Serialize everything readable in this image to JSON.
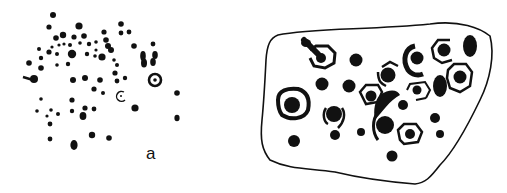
{
  "figure": {
    "panels": [
      {
        "id": "a",
        "label": "a",
        "description": "Scattered cup-marks (dots) with one concentric ring and one small open ring"
      },
      {
        "id": "b",
        "label": "b",
        "description": "Rock surface outline with cup-marks surrounded by rings and arcs"
      }
    ],
    "colors": {
      "ink": "#111111",
      "background": "#ffffff"
    }
  }
}
